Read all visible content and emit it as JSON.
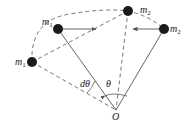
{
  "diagram": {
    "type": "physics-rotation-diagram",
    "colors": {
      "line": "#555555",
      "mass": "#1a1a1a",
      "background": "#ffffff"
    },
    "labels": {
      "m1_upper": "m",
      "m1_upper_sub": "1",
      "m1_lower": "m",
      "m1_lower_sub": "1",
      "m2_top": "m",
      "m2_top_sub": "2",
      "m2_right": "m",
      "m2_right_sub": "2",
      "dtheta": "dθ",
      "theta": "θ",
      "origin": "O"
    },
    "points": {
      "O": [
        116,
        110
      ],
      "m1_upper": [
        58,
        29
      ],
      "m1_lower": [
        32,
        62
      ],
      "m2_top": [
        128,
        11
      ],
      "m2_right": [
        164,
        29
      ]
    }
  }
}
